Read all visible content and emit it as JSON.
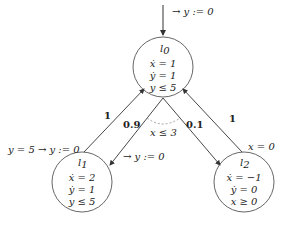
{
  "diagram": {
    "type": "probabilistic hybrid automaton",
    "initial_edge": {
      "label": "→ y := 0"
    },
    "locations": [
      {
        "id": "l0",
        "name": "l0",
        "name_sub": "0",
        "flow": [
          "ẋ = 1",
          "ẏ = 1"
        ],
        "invariant": "y ≤ 5"
      },
      {
        "id": "l1",
        "name": "l1",
        "name_sub": "1",
        "flow": [
          "ẋ = 2",
          "ẏ = 1"
        ],
        "invariant": "y ≤ 5"
      },
      {
        "id": "l2",
        "name": "l2",
        "name_sub": "2",
        "flow": [
          "ẋ = −1",
          "ẏ = 0"
        ],
        "invariant": "x ≥ 0"
      }
    ],
    "edges": [
      {
        "from": "l1",
        "to": "l0",
        "probability": "1",
        "guard_update": "y = 5 → y := 0"
      },
      {
        "from": "l0",
        "to": "l1",
        "probability": "0.9",
        "update": "→ y := 0",
        "guard": "x ≤ 3"
      },
      {
        "from": "l0",
        "to": "l2",
        "probability": "0.1",
        "guard": "x ≤ 3"
      },
      {
        "from": "l2",
        "to": "l0",
        "probability": "1",
        "guard": "x = 0"
      }
    ],
    "labels": {
      "init": "→ y := 0",
      "l0_name": "l",
      "l0_sub": "0",
      "l0_f1": "ẋ = 1",
      "l0_f2": "ẏ = 1",
      "l0_inv": "y ≤ 5",
      "l1_name": "l",
      "l1_sub": "1",
      "l1_f1": "ẋ = 2",
      "l1_f2": "ẏ = 1",
      "l1_inv": "y ≤ 5",
      "l2_name": "l",
      "l2_sub": "2",
      "l2_f1": "ẋ = −1",
      "l2_f2": "ẏ = 0",
      "l2_inv": "x ≥ 0",
      "p_l1_l0": "1",
      "p_l0_l1": "0.9",
      "p_l0_l2": "0.1",
      "p_l2_l0": "1",
      "g_l1_l0": "y = 5 → y := 0",
      "u_l0_l1": "→ y := 0",
      "g_l0": "x ≤ 3",
      "g_l2_l0": "x = 0"
    },
    "colors": {
      "stroke": "#333333",
      "guard_arc": "#999999"
    }
  }
}
